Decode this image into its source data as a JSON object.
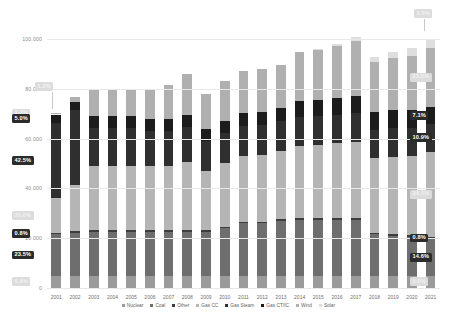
{
  "chart_data": {
    "type": "bar",
    "stacked": true,
    "title": "",
    "subtitle": "",
    "xlabel": "",
    "ylabel": "",
    "ylim": [
      0,
      110000
    ],
    "grid": true,
    "legend_position": "bottom",
    "ytick_labels": [
      "0",
      "20.000",
      "40.000",
      "60.000",
      "80.000",
      "100.000"
    ],
    "ytick_values": [
      0,
      20000,
      40000,
      60000,
      80000,
      100000
    ],
    "categories": [
      "2001",
      "2002",
      "2003",
      "2004",
      "2005",
      "2006",
      "2007",
      "2008",
      "2009",
      "2010",
      "2011",
      "2012",
      "2013",
      "2014",
      "2015",
      "2016",
      "2017",
      "2018",
      "2019",
      "2020",
      "2021"
    ],
    "series": [
      {
        "name": "Nuclear",
        "color": "#9b9b9b",
        "values": [
          4900,
          5000,
          5000,
          5000,
          5000,
          5000,
          5000,
          5000,
          5000,
          5000,
          5000,
          5000,
          5000,
          5000,
          5000,
          5000,
          5000,
          5000,
          5000,
          5000,
          5000
        ]
      },
      {
        "name": "Coal",
        "color": "#6e6e6e",
        "values": [
          16600,
          17200,
          17500,
          17500,
          17500,
          17500,
          17500,
          17500,
          17500,
          19000,
          21000,
          21000,
          22000,
          22500,
          22500,
          22500,
          22500,
          16500,
          16000,
          15500,
          14600
        ]
      },
      {
        "name": "Other",
        "color": "#3d3d3d",
        "values": [
          560,
          600,
          600,
          600,
          600,
          600,
          600,
          600,
          600,
          600,
          600,
          600,
          600,
          600,
          600,
          600,
          600,
          600,
          600,
          600,
          800
        ]
      },
      {
        "name": "Gas CC",
        "color": "#b5b5b5",
        "values": [
          14100,
          18500,
          26000,
          26000,
          26000,
          26000,
          26000,
          27500,
          24000,
          25500,
          26500,
          27000,
          27500,
          29000,
          29500,
          30000,
          30500,
          30000,
          31000,
          32000,
          34400
        ]
      },
      {
        "name": "Gas Steam",
        "color": "#2f2f2f",
        "values": [
          30000,
          30000,
          15000,
          15000,
          15000,
          14000,
          14000,
          14000,
          12000,
          12000,
          12000,
          12000,
          12000,
          11500,
          11500,
          11500,
          11500,
          11500,
          11500,
          11000,
          10900
        ]
      },
      {
        "name": "Gas CT/IC",
        "color": "#1c1c1c",
        "values": [
          3500,
          3500,
          4800,
          4800,
          4800,
          4800,
          4800,
          4800,
          4800,
          5000,
          5000,
          5000,
          5000,
          6500,
          6500,
          6500,
          7000,
          7200,
          7200,
          7200,
          7100
        ]
      },
      {
        "name": "Wind",
        "color": "#b0b0b0",
        "values": [
          500,
          1800,
          10500,
          10500,
          10500,
          11500,
          13500,
          16500,
          14000,
          16000,
          17000,
          17500,
          17500,
          19500,
          20000,
          21000,
          22000,
          20000,
          21000,
          22000,
          23600
        ]
      },
      {
        "name": "Solar",
        "color": "#dedede",
        "values": [
          0,
          0,
          0,
          0,
          0,
          0,
          0,
          0,
          0,
          0,
          0,
          0,
          0,
          0,
          500,
          800,
          1500,
          2000,
          2500,
          3000,
          3500
        ]
      }
    ],
    "annotations_left": [
      {
        "label": "1.2%",
        "style": "light",
        "series": "Solar"
      },
      {
        "label": "5.0%",
        "style": "dark",
        "series": "Gas CT/IC"
      },
      {
        "label": "42.5%",
        "style": "dark",
        "series": "Gas Steam"
      },
      {
        "label": "20.0%",
        "style": "light",
        "series": "Gas CC"
      },
      {
        "label": "0.8%",
        "style": "dark",
        "series": "Other"
      },
      {
        "label": "23.5%",
        "style": "dark",
        "series": "Coal"
      },
      {
        "label": "6.9%",
        "style": "light",
        "series": "Nuclear"
      }
    ],
    "annotations_right": [
      {
        "label": "3.5%",
        "style": "light",
        "series": "Solar"
      },
      {
        "label": "23.6%",
        "style": "light",
        "series": "Wind"
      },
      {
        "label": "7.1%",
        "style": "dark",
        "series": "Gas CT/IC"
      },
      {
        "label": "10.9%",
        "style": "dark",
        "series": "Gas Steam"
      },
      {
        "label": "34.4%",
        "style": "light",
        "series": "Gas CC"
      },
      {
        "label": "0.8%",
        "style": "dark",
        "series": "Other"
      },
      {
        "label": "14.6%",
        "style": "dark",
        "series": "Coal"
      },
      {
        "label": "5.0%",
        "style": "light",
        "series": "Nuclear"
      }
    ]
  },
  "legend": {
    "items": [
      {
        "label": "Nuclear",
        "color": "#9b9b9b"
      },
      {
        "label": "Coal",
        "color": "#6e6e6e"
      },
      {
        "label": "Other",
        "color": "#3d3d3d"
      },
      {
        "label": "Gas CC",
        "color": "#b5b5b5"
      },
      {
        "label": "Gas Steam",
        "color": "#2f2f2f"
      },
      {
        "label": "Gas CT/IC",
        "color": "#1c1c1c"
      },
      {
        "label": "Wind",
        "color": "#b0b0b0"
      },
      {
        "label": "Solar",
        "color": "#dedede"
      }
    ]
  },
  "caption": {
    "text": ""
  }
}
